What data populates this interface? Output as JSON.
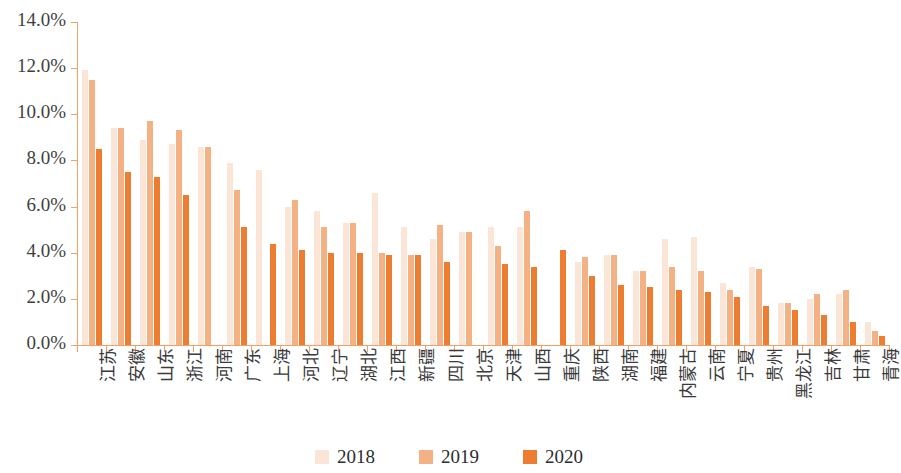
{
  "chart_data": {
    "type": "bar",
    "title": "",
    "subtitle": "",
    "xlabel": "",
    "ylabel": "",
    "ylim": [
      0,
      14
    ],
    "y_tick_labels": [
      "0.0%",
      "2.0%",
      "4.0%",
      "6.0%",
      "8.0%",
      "10.0%",
      "12.0%",
      "14.0%"
    ],
    "y_tick_values": [
      0,
      2,
      4,
      6,
      8,
      10,
      12,
      14
    ],
    "y_unit": "%",
    "grid": false,
    "legend_position": "bottom-center",
    "categories": [
      "江苏",
      "安徽",
      "山东",
      "浙江",
      "河南",
      "广东",
      "上海",
      "河北",
      "辽宁",
      "湖北",
      "江西",
      "新疆",
      "四川",
      "北京",
      "天津",
      "山西",
      "重庆",
      "陕西",
      "湖南",
      "福建",
      "内蒙古",
      "云南",
      "宁夏",
      "贵州",
      "黑龙江",
      "吉林",
      "甘肃",
      "青海"
    ],
    "series": [
      {
        "name": "2018",
        "color": "#FBE5D6",
        "values": [
          11.9,
          9.4,
          8.9,
          8.7,
          8.6,
          7.9,
          7.6,
          6.0,
          5.8,
          5.3,
          6.6,
          5.1,
          4.6,
          4.9,
          5.1,
          5.1,
          null,
          3.6,
          3.9,
          3.2,
          4.6,
          4.7,
          2.7,
          3.4,
          1.8,
          2.0,
          2.2,
          1.0
        ]
      },
      {
        "name": "2019",
        "color": "#F4B183",
        "values": [
          11.5,
          9.4,
          9.7,
          9.3,
          8.6,
          6.7,
          null,
          6.3,
          5.1,
          5.3,
          4.0,
          3.9,
          5.2,
          4.9,
          4.3,
          5.8,
          null,
          3.8,
          3.9,
          3.2,
          3.4,
          3.2,
          2.4,
          3.3,
          1.8,
          2.2,
          2.4,
          0.6
        ]
      },
      {
        "name": "2020",
        "color": "#ED7D31",
        "values": [
          8.5,
          7.5,
          7.3,
          6.5,
          null,
          5.1,
          4.4,
          4.1,
          4.0,
          4.0,
          3.9,
          3.9,
          3.6,
          null,
          3.5,
          3.4,
          4.1,
          3.0,
          2.6,
          2.5,
          2.4,
          2.3,
          2.1,
          1.7,
          1.5,
          1.3,
          1.0,
          0.4
        ]
      }
    ]
  },
  "legend": {
    "items": [
      {
        "label": "2018",
        "color": "#FBE5D6"
      },
      {
        "label": "2019",
        "color": "#F4B183"
      },
      {
        "label": "2020",
        "color": "#ED7D31"
      }
    ]
  },
  "axis": {
    "axis_color": "#F2A166"
  }
}
